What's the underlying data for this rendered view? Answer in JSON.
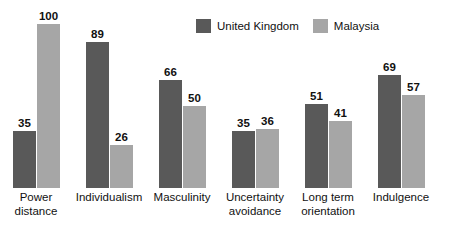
{
  "chart_data": {
    "type": "bar",
    "title": "",
    "subtitle": "",
    "xlabel": "",
    "ylabel": "",
    "ylim": [
      0,
      100
    ],
    "grid": false,
    "legend_position": "top-center",
    "categories": [
      "Power distance",
      "Individualism",
      "Masculinity",
      "Uncertainty avoidance",
      "Long term orientation",
      "Indulgence"
    ],
    "category_lines": [
      [
        "Power",
        "distance"
      ],
      [
        "Individualism"
      ],
      [
        "Masculinity"
      ],
      [
        "Uncertainty",
        "avoidance"
      ],
      [
        "Long term",
        "orientation"
      ],
      [
        "Indulgence"
      ]
    ],
    "series": [
      {
        "name": "United Kingdom",
        "color": "#595959",
        "values": [
          35,
          89,
          66,
          35,
          51,
          69
        ]
      },
      {
        "name": "Malaysia",
        "color": "#a6a6a6",
        "values": [
          100,
          26,
          50,
          36,
          41,
          57
        ]
      }
    ]
  },
  "legend": {
    "entries": [
      {
        "label": "United Kingdom",
        "color": "#595959"
      },
      {
        "label": "Malaysia",
        "color": "#a6a6a6"
      }
    ]
  },
  "colors": {
    "background": "#ffffff",
    "uk": "#595959",
    "malaysia": "#a6a6a6",
    "text": "#111111"
  }
}
